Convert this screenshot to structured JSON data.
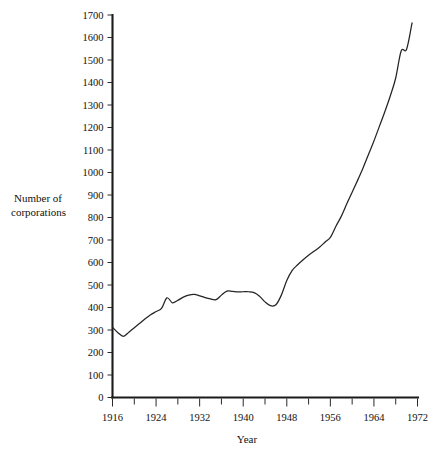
{
  "figure": {
    "background_color": "#ffffff",
    "line_color": "#242424",
    "axis_color": "#1b1b1b"
  },
  "labels": {
    "ylabel_line1": "Number of",
    "ylabel_line2": "corporations",
    "xlabel": "Year"
  },
  "chart_data": {
    "type": "line",
    "title": "",
    "xlabel": "Year",
    "ylabel": "Number of corporations",
    "xlim": [
      1916,
      1972
    ],
    "ylim": [
      0,
      1700
    ],
    "grid": false,
    "legend": null,
    "x_major_ticks": [
      1916,
      1924,
      1932,
      1940,
      1948,
      1956,
      1964,
      1972
    ],
    "x_minor_ticks": [
      1920,
      1928,
      1936,
      1944,
      1952,
      1960,
      1968
    ],
    "x_tick_labels": [
      "1916",
      "1924",
      "1932",
      "1940",
      "1948",
      "1956",
      "1964",
      "1972"
    ],
    "y_ticks": [
      0,
      100,
      200,
      300,
      400,
      500,
      600,
      700,
      800,
      900,
      1000,
      1100,
      1200,
      1300,
      1400,
      1500,
      1600,
      1700
    ],
    "y_tick_labels": [
      "0",
      "100",
      "200",
      "300",
      "400",
      "500",
      "600",
      "700",
      "800",
      "900",
      "1000",
      "1100",
      "1200",
      "1300",
      "1400",
      "1500",
      "1600",
      "1700"
    ],
    "series": [
      {
        "name": "Number of corporations",
        "x": [
          1916,
          1917,
          1918,
          1919,
          1920,
          1921,
          1922,
          1923,
          1924,
          1925,
          1926,
          1927,
          1928,
          1929,
          1930,
          1931,
          1932,
          1933,
          1934,
          1935,
          1936,
          1937,
          1938,
          1939,
          1940,
          1941,
          1942,
          1943,
          1944,
          1945,
          1946,
          1947,
          1948,
          1949,
          1950,
          1951,
          1952,
          1953,
          1954,
          1955,
          1956,
          1957,
          1958,
          1959,
          1960,
          1961,
          1962,
          1963,
          1964,
          1965,
          1966,
          1967,
          1968,
          1969,
          1970
        ],
        "y": [
          312,
          288,
          272,
          290,
          310,
          330,
          350,
          368,
          382,
          396,
          443,
          421,
          432,
          446,
          455,
          458,
          452,
          444,
          438,
          435,
          455,
          473,
          472,
          469,
          470,
          470,
          466,
          450,
          425,
          408,
          412,
          455,
          520,
          565,
          590,
          612,
          632,
          650,
          668,
          690,
          712,
          760,
          805,
          860,
          912,
          965,
          1020,
          1080,
          1140,
          1205,
          1270,
          1340,
          1420,
          1540,
          1548
        ],
        "y_end_point": 1665,
        "x_end_point": 1971,
        "notable_points": {
          "start_1916": 312,
          "early_trough_1918": 272,
          "peak_1926": 443,
          "plateau_1930s": 455,
          "wartime_trough_1945": 408,
          "postwar_1948": 520,
          "final_1971": 1665
        }
      }
    ]
  }
}
